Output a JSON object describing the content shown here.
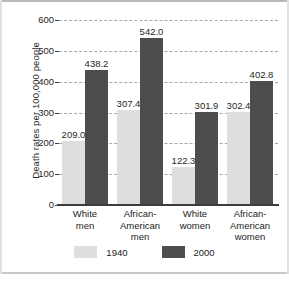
{
  "chart_data": {
    "type": "bar",
    "title": "",
    "xlabel": "",
    "ylabel": "Death rates per 100,000 people",
    "ylim": [
      0,
      600
    ],
    "yticks": [
      0,
      100,
      200,
      300,
      400,
      500,
      600
    ],
    "ytick_labels": [
      "0",
      "100",
      "200",
      "300",
      "400",
      "500",
      "600"
    ],
    "grid": true,
    "legend_position": "bottom",
    "categories": [
      "White men",
      "African-American men",
      "White women",
      "African-American women"
    ],
    "category_lines": [
      [
        "White",
        "men"
      ],
      [
        "African-",
        "American",
        "men"
      ],
      [
        "White",
        "women"
      ],
      [
        "African-",
        "American",
        "women"
      ]
    ],
    "series": [
      {
        "name": "1940",
        "color": "#dedede",
        "values": [
          209.0,
          307.4,
          122.3,
          302.4
        ],
        "labels": [
          "209.0",
          "307.4",
          "122.3",
          "302.4"
        ]
      },
      {
        "name": "2000",
        "color": "#4d4d4d",
        "values": [
          438.2,
          542.0,
          301.9,
          402.8
        ],
        "labels": [
          "438.2",
          "542.0",
          "301.9",
          "402.8"
        ]
      }
    ]
  },
  "legend": {
    "items": [
      {
        "label": "1940",
        "swatch": "light-gray-swatch-icon"
      },
      {
        "label": "2000",
        "swatch": "dark-gray-swatch-icon"
      }
    ]
  }
}
